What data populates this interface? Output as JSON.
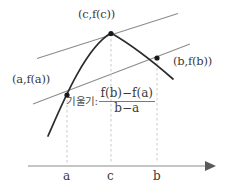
{
  "figure": {
    "type": "mean-value-theorem-diagram",
    "labels": {
      "point_c": "(c,f(c))",
      "point_b": "(b,f(b))",
      "point_a": "(a,f(a))",
      "slope_word": "기울기:",
      "fraction_numerator": "f(b)−f(a)",
      "fraction_denominator": "b−a",
      "axis_tick_a": "a",
      "axis_tick_c": "c",
      "axis_tick_b": "b"
    },
    "colors": {
      "curve": "#2b2b2b",
      "line": "#8c8c8c",
      "axis": "#8c8c8c",
      "dashed": "#c9c9c9",
      "text": "#3a3a3a",
      "point": "#1a1a1a",
      "background": "#ffffff"
    },
    "geometry": {
      "axis_y": 166,
      "axis_x_start": 28,
      "axis_x_end": 212,
      "tick_a_x": 67,
      "tick_c_x": 111,
      "tick_b_x": 157,
      "point_a": [
        67,
        95
      ],
      "point_c": [
        111,
        33
      ],
      "point_b": [
        157,
        58
      ],
      "tangent_line": [
        [
          37,
          58
        ],
        [
          178,
          13
        ]
      ],
      "secant_line": [
        [
          33,
          104
        ],
        [
          190,
          44
        ]
      ],
      "curve_start": [
        48,
        136
      ],
      "curve_end": [
        173,
        79
      ]
    }
  }
}
